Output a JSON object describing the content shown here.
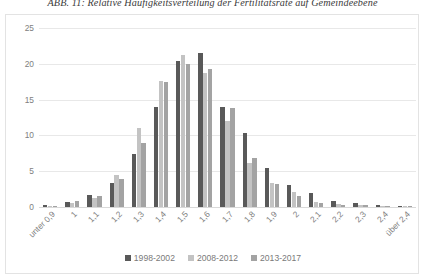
{
  "caption": "ABB. 11: Relative Häufigkeitsverteilung der Fertilitätsrate auf Gemeindeebene",
  "legend": {
    "items": [
      {
        "label": "1998-2002",
        "color": "#595959"
      },
      {
        "label": "2008-2012",
        "color": "#c3c3c3"
      },
      {
        "label": "2013-2017",
        "color": "#a3a3a3"
      }
    ]
  },
  "chart_data": {
    "type": "bar",
    "title": "ABB. 11: Relative Häufigkeitsverteilung der Fertilitätsrate auf Gemeindeebene",
    "xlabel": "",
    "ylabel": "",
    "ylim": [
      0,
      25
    ],
    "yticks": [
      0,
      5,
      10,
      15,
      20,
      25
    ],
    "grid": true,
    "legend_position": "bottom",
    "categories": [
      "unter 0,9",
      "1",
      "1,1",
      "1,2",
      "1,3",
      "1,4",
      "1,5",
      "1,6",
      "1,7",
      "1,8",
      "1,9",
      "2",
      "2,1",
      "2,2",
      "2,3",
      "2,4",
      "über 2,4"
    ],
    "series": [
      {
        "name": "1998-2002",
        "color": "#595959",
        "values": [
          0.3,
          0.7,
          1.7,
          3.3,
          7.4,
          13.9,
          20.4,
          21.5,
          14.0,
          10.4,
          5.4,
          3.1,
          1.9,
          0.9,
          0.5,
          0.3,
          0.2
        ]
      },
      {
        "name": "2008-2012",
        "color": "#c3c3c3",
        "values": [
          0.2,
          0.6,
          1.3,
          4.5,
          11.0,
          17.6,
          21.2,
          18.7,
          12.0,
          6.2,
          3.4,
          2.1,
          0.7,
          0.4,
          0.3,
          0.2,
          0.1
        ]
      },
      {
        "name": "2013-2017",
        "color": "#a3a3a3",
        "values": [
          0.2,
          0.8,
          1.5,
          3.9,
          8.9,
          17.4,
          20.0,
          19.3,
          13.8,
          6.9,
          3.2,
          1.6,
          0.6,
          0.3,
          0.3,
          0.2,
          0.1
        ]
      }
    ]
  }
}
